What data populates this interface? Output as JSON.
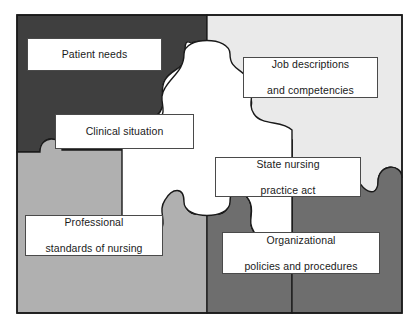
{
  "colors": {
    "quadrant_top_left": "#3f3f3f",
    "quadrant_top_right": "#eaeaea",
    "quadrant_bottom_left": "#b0b0b0",
    "quadrant_bottom_right": "#6e6e6e",
    "center_piece": "#ffffff",
    "outline": "#1a1a1a",
    "label_background": "#ffffff",
    "label_border": "#4a4a4a",
    "label_text": "#1a1a1a",
    "page_background": "#ffffff"
  },
  "pieces": [
    {
      "id": "patient-needs",
      "quadrant": "top-left",
      "fill": "#3f3f3f"
    },
    {
      "id": "job-descriptions",
      "quadrant": "top-right",
      "fill": "#eaeaea"
    },
    {
      "id": "professional",
      "quadrant": "bottom-left",
      "fill": "#b0b0b0"
    },
    {
      "id": "organizational",
      "quadrant": "bottom-right",
      "fill": "#6e6e6e"
    },
    {
      "id": "clinical-situation",
      "quadrant": "center",
      "fill": "#ffffff"
    }
  ],
  "labels": {
    "patient_needs": "Patient needs",
    "job_descriptions_line1": "Job descriptions",
    "job_descriptions_line2": "and competencies",
    "clinical_situation": "Clinical situation",
    "state_nursing_line1": "State nursing",
    "state_nursing_line2": "practice act",
    "professional_line1": "Professional",
    "professional_line2": "standards of nursing",
    "organizational_line1": "Organizational",
    "organizational_line2": "policies and procedures"
  }
}
